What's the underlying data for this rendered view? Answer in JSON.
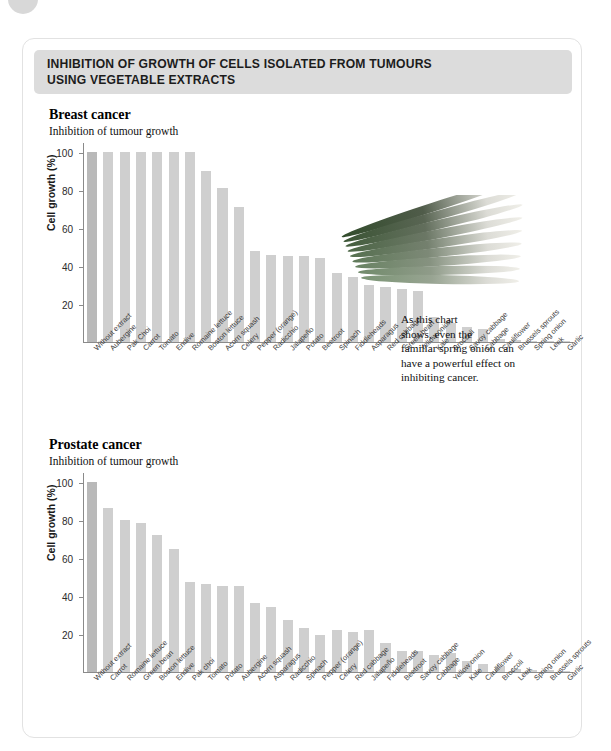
{
  "banner": {
    "title": "INHIBITION OF GROWTH OF CELLS ISOLATED FROM TUMOURS\nUSING VEGETABLE EXTRACTS"
  },
  "colors": {
    "banner_bg": "#dcdcdc",
    "bar": "#cfcfcf",
    "bar_first": "#b9b9b9",
    "axis": "#8a8a8a",
    "card_border": "#e2e2e2"
  },
  "breast": {
    "title": "Breast cancer",
    "subtitle": "Inhibition of tumour growth",
    "note": "As this chart\nshows, even the\nfamiliar spring onion can\nhave a powerful effect on\ninhibiting cancer.",
    "photo_name": "spring-onion-photo"
  },
  "prostate": {
    "title": "Prostate cancer",
    "subtitle": "Inhibition of tumour growth",
    "note": "Kale enjoys wide recognition as\na highly nutritious vegetable, but it\nalso possesses the potency to slow\nthe growth of cancer cells.",
    "photo_name": "kale-photo"
  },
  "chart_data": [
    {
      "id": "breast",
      "type": "bar",
      "title": "Breast cancer",
      "subtitle": "Inhibition of tumour growth",
      "xlabel": "",
      "ylabel": "Cell growth (%)",
      "ylim": [
        0,
        105
      ],
      "yticks": [
        20,
        40,
        60,
        80,
        100
      ],
      "grid": false,
      "legend": "none",
      "categories": [
        "Without extract",
        "Aubergine",
        "Pak Choi",
        "Carrot",
        "Tomato",
        "Endive",
        "Romaine lettuce",
        "Boston lettuce",
        "Acorn squash",
        "Celery",
        "Pepper (orange)",
        "Radicchio",
        "Jalapeño",
        "Potato",
        "Beetroot",
        "Spinach",
        "Fiddleheads",
        "Asparagus",
        "Red cabbage",
        "Green bean",
        "Yellow onion",
        "Kale",
        "Broccoli",
        "Savoy cabbage",
        "Cabbage",
        "Cauliflower",
        "Brussels sprouts",
        "Spring onion",
        "Leek",
        "Garlic"
      ],
      "values": [
        100,
        100,
        100,
        100,
        100,
        100,
        100,
        90,
        81,
        71,
        48,
        45.5,
        45,
        45,
        44,
        36,
        34,
        30,
        29,
        28,
        27,
        13,
        10,
        8,
        7,
        1.5,
        0.8,
        0.5,
        0.4,
        0.3
      ]
    },
    {
      "id": "prostate",
      "type": "bar",
      "title": "Prostate cancer",
      "subtitle": "Inhibition of tumour growth",
      "xlabel": "",
      "ylabel": "Cell growth (%)",
      "ylim": [
        0,
        105
      ],
      "yticks": [
        20,
        40,
        60,
        80,
        100
      ],
      "grid": false,
      "legend": "none",
      "categories": [
        "Without extract",
        "Carrot",
        "Romaine lettuce",
        "Green bean",
        "Boston lettuce",
        "Endive",
        "Pak choi",
        "Tomato",
        "Potato",
        "Aubergine",
        "Acorn squash",
        "Asparagus",
        "Radicchio",
        "Spinach",
        "Pepper (orange)",
        "Celery",
        "Red cabbage",
        "Jalapeño",
        "Fiddleheads",
        "Beetroot",
        "Savoy cabbage",
        "Cabbage",
        "Yellow onion",
        "Kale",
        "Cauliflower",
        "Broccoli",
        "Leek",
        "Spring onion",
        "Brussels sprouts",
        "Garlic"
      ],
      "values": [
        100,
        86,
        80,
        78,
        72,
        64.5,
        47,
        46,
        45,
        45,
        36,
        34,
        27.5,
        23,
        19.5,
        22,
        21,
        22,
        15,
        11,
        11,
        9,
        10,
        6,
        4,
        3,
        1.5,
        1,
        0.8,
        0.6
      ]
    }
  ]
}
